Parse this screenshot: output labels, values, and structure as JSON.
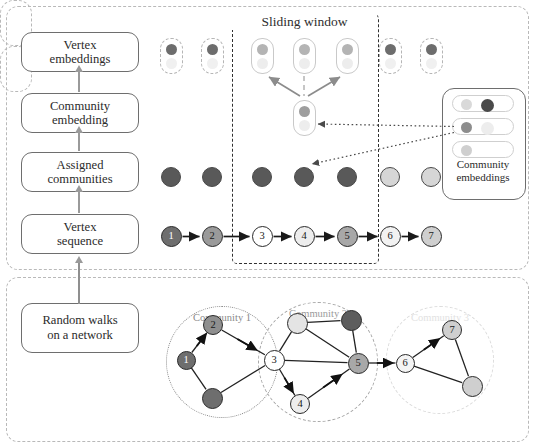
{
  "figure": {
    "title": "Sliding window",
    "panels": {
      "top": "pipeline-panel",
      "bottom": "network-panel"
    }
  },
  "stages": [
    {
      "id": "vertex-embeddings",
      "label": "Vertex\nembeddings"
    },
    {
      "id": "community-embedding",
      "label": "Community\nembedding"
    },
    {
      "id": "assigned-communities",
      "label": "Assigned\ncommunities"
    },
    {
      "id": "vertex-sequence",
      "label": "Vertex\nsequence"
    },
    {
      "id": "random-walks",
      "label": "Random walks\non a network"
    }
  ],
  "stage_labels": {
    "vertex_embeddings_line1": "Vertex",
    "vertex_embeddings_line2": "embeddings",
    "community_embedding_line1": "Community",
    "community_embedding_line2": "embedding",
    "assigned_communities_line1": "Assigned",
    "assigned_communities_line2": "communities",
    "vertex_sequence_line1": "Vertex",
    "vertex_sequence_line2": "sequence",
    "random_walks_line1": "Random walks",
    "random_walks_line2": "on a network"
  },
  "sliding_window": {
    "label": "Sliding window",
    "covers_vertices": [
      3,
      4,
      5
    ]
  },
  "vertex_sequence": {
    "nodes": [
      {
        "id": 1,
        "label": "1",
        "fill": "#6e6e6e",
        "text_color": "#ffffff"
      },
      {
        "id": 2,
        "label": "2",
        "fill": "#9a9a9a",
        "text_color": "#1a1a1a"
      },
      {
        "id": 3,
        "label": "3",
        "fill": "#ffffff",
        "text_color": "#1a1a1a"
      },
      {
        "id": 4,
        "label": "4",
        "fill": "#ededed",
        "text_color": "#1a1a1a"
      },
      {
        "id": 5,
        "label": "5",
        "fill": "#a8a8a8",
        "text_color": "#1a1a1a"
      },
      {
        "id": 6,
        "label": "6",
        "fill": "#f2f2f2",
        "text_color": "#1a1a1a"
      },
      {
        "id": 7,
        "label": "7",
        "fill": "#cfcfcf",
        "text_color": "#1a1a1a"
      }
    ],
    "arrow_color": "#1a1a1a"
  },
  "assigned_communities": {
    "circles": [
      {
        "index": 1,
        "community": 1,
        "fill": "#595959"
      },
      {
        "index": 2,
        "community": 1,
        "fill": "#595959"
      },
      {
        "index": 3,
        "community": 1,
        "fill": "#595959"
      },
      {
        "index": 4,
        "community": 1,
        "fill": "#595959"
      },
      {
        "index": 5,
        "community": 1,
        "fill": "#595959"
      },
      {
        "index": 6,
        "community": 2,
        "fill": "#d6d6d6"
      },
      {
        "index": 7,
        "community": 2,
        "fill": "#d6d6d6"
      }
    ]
  },
  "vertex_embeddings": {
    "pills": [
      {
        "index": 1,
        "style": "ghost",
        "in_window": false
      },
      {
        "index": 2,
        "style": "ghost",
        "in_window": false
      },
      {
        "index": 3,
        "style": "solid",
        "in_window": true,
        "role": "context-left"
      },
      {
        "index": 4,
        "style": "solid",
        "in_window": true,
        "role": "center"
      },
      {
        "index": 5,
        "style": "solid",
        "in_window": true,
        "role": "context-right"
      },
      {
        "index": 6,
        "style": "ghost",
        "in_window": false
      },
      {
        "index": 7,
        "style": "ghost",
        "in_window": false
      }
    ],
    "center_copy": {
      "role": "target-embedding",
      "style": "solid"
    }
  },
  "community_embeddings": {
    "caption_line1": "Community",
    "caption_line2": "embeddings",
    "pills": [
      {
        "index": 1,
        "left_dot": "#d9d9d9",
        "right_dot": "#4a4a4a"
      },
      {
        "index": 2,
        "left_dot": "#8d8d8d",
        "right_dot": "#ededed"
      },
      {
        "index": 3,
        "left_dot": "#cfcfcf",
        "right_dot": null
      }
    ]
  },
  "network": {
    "communities": [
      {
        "id": 1,
        "label": "Community 1",
        "border_style": "dotted",
        "border_color": "#8a8a8a",
        "label_color": "#8a8a8a"
      },
      {
        "id": 2,
        "label": "Community 2",
        "border_style": "dashed",
        "border_color": "#a8a8a8",
        "label_color": "#9a9a9a"
      },
      {
        "id": 3,
        "label": "Community 3",
        "border_style": "dashdot",
        "border_color": "#dcdcdc",
        "label_color": "#e2e2e2"
      }
    ],
    "nodes": [
      {
        "id": "1",
        "label": "1",
        "fill": "#6e6e6e",
        "text_color": "#ffffff",
        "community": 1
      },
      {
        "id": "2",
        "label": "2",
        "fill": "#8f8f8f",
        "text_color": "#1a1a1a",
        "community": 1
      },
      {
        "id": "3",
        "label": "3",
        "fill": "#ffffff",
        "text_color": "#1a1a1a",
        "community": 1
      },
      {
        "id": "4",
        "label": "4",
        "fill": "#ededed",
        "text_color": "#1a1a1a",
        "community": 2
      },
      {
        "id": "5",
        "label": "5",
        "fill": "#a8a8a8",
        "text_color": "#1a1a1a",
        "community": 2
      },
      {
        "id": "6",
        "label": "6",
        "fill": "#f4f4f4",
        "text_color": "#1a1a1a",
        "community": 3
      },
      {
        "id": "7",
        "label": "7",
        "fill": "#cfcfcf",
        "text_color": "#1a1a1a",
        "community": 3
      },
      {
        "id": "a",
        "label": "",
        "fill": "#6e6e6e",
        "text_color": "#ffffff",
        "community": 1
      },
      {
        "id": "b",
        "label": "",
        "fill": "#e4e4e4",
        "text_color": "#1a1a1a",
        "community": 2
      },
      {
        "id": "c",
        "label": "",
        "fill": "#5d5d5d",
        "text_color": "#ffffff",
        "community": 2
      },
      {
        "id": "d",
        "label": "",
        "fill": "#cfcfcf",
        "text_color": "#1a1a1a",
        "community": 3
      }
    ],
    "walk_path": [
      "1",
      "2",
      "3",
      "4",
      "5",
      "6",
      "7"
    ]
  }
}
